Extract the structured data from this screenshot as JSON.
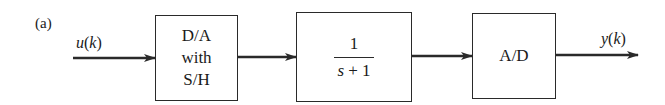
{
  "figure": {
    "panel_label": "(a)",
    "input_signal": {
      "name": "u",
      "arg": "k"
    },
    "output_signal": {
      "name": "y",
      "arg": "k"
    },
    "blocks": [
      {
        "id": "dac",
        "lines": [
          "D/A",
          "with",
          "S/H"
        ]
      },
      {
        "id": "plant",
        "numerator": "1",
        "denominator_var": "s",
        "denominator_rest": " + 1"
      },
      {
        "id": "adc",
        "label": "A/D"
      }
    ],
    "connections": [
      {
        "from": "u(k)",
        "to": "dac"
      },
      {
        "from": "dac",
        "to": "plant"
      },
      {
        "from": "plant",
        "to": "adc"
      },
      {
        "from": "adc",
        "to": "y(k)"
      }
    ],
    "colors": {
      "line": "#2a2a2a",
      "text": "#1a1a1a",
      "background": "#ffffff"
    }
  }
}
